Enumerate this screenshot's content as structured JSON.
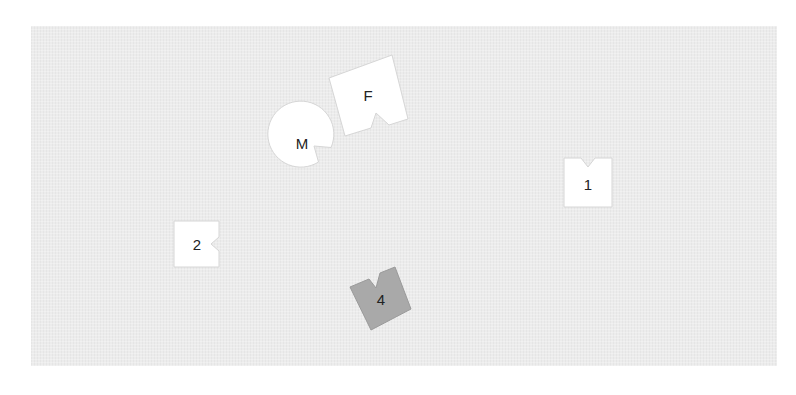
{
  "canvas": {
    "background": "#ffffff",
    "panel_color": "#ececec"
  },
  "shapes": [
    {
      "id": "M",
      "label": "M",
      "kind": "circle-with-notch",
      "fill": "#ffffff"
    },
    {
      "id": "F",
      "label": "F",
      "kind": "square-with-notch",
      "fill": "#ffffff"
    },
    {
      "id": "1",
      "label": "1",
      "kind": "square-with-notch",
      "fill": "#ffffff"
    },
    {
      "id": "2",
      "label": "2",
      "kind": "square-with-notch",
      "fill": "#ffffff"
    },
    {
      "id": "4",
      "label": "4",
      "kind": "square-with-notch",
      "fill": "#a9a9a9"
    }
  ]
}
